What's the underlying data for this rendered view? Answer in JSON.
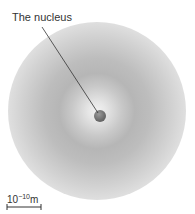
{
  "diagram": {
    "label": "The nucleus",
    "scale": {
      "base": "10",
      "exponent": "−10",
      "unit": "m"
    }
  }
}
